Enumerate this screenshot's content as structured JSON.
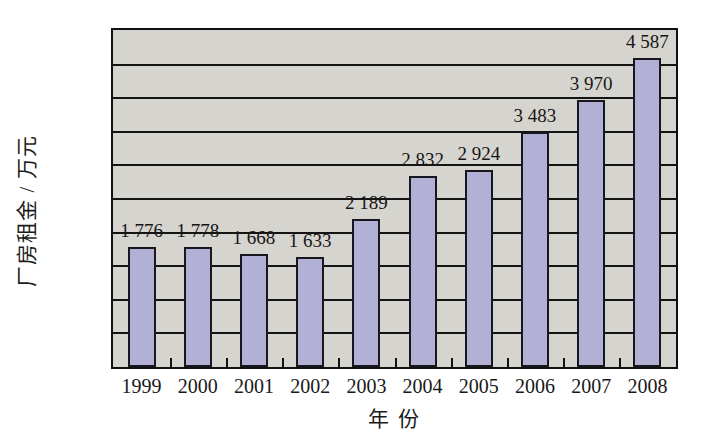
{
  "chart_data": {
    "type": "bar",
    "title": "",
    "xlabel": "年 份",
    "ylabel": "厂房租金 / 万元",
    "categories": [
      "1999",
      "2000",
      "2001",
      "2002",
      "2003",
      "2004",
      "2005",
      "2006",
      "2007",
      "2008"
    ],
    "values": [
      1776,
      1778,
      1668,
      1633,
      2189,
      2832,
      2924,
      3483,
      3970,
      4587
    ],
    "value_labels": [
      "1 776",
      "1 778",
      "1 668",
      "1 633",
      "2 189",
      "2 832",
      "2 924",
      "3 483",
      "3 970",
      "4 587"
    ],
    "ylim": [
      0,
      5000
    ],
    "ytick_values": [
      0,
      500,
      1000,
      1500,
      2000,
      2500,
      3000,
      3500,
      4000,
      4500,
      5000
    ],
    "ytick_labels": [
      "0",
      "500",
      "1 000",
      "1 500",
      "2 000",
      "2 500",
      "3 000",
      "3 500",
      "4 000",
      "4 500",
      "5 000"
    ],
    "grid": true,
    "legend": "none",
    "series_name": "厂房租金",
    "colors": {
      "bar_fill": "#b3b0d6",
      "bar_outline": "#16161c",
      "plot_background": "#d6d4ce",
      "axis": "#101010",
      "text": "#1a1a1a",
      "page_background": "#ffffff"
    }
  }
}
